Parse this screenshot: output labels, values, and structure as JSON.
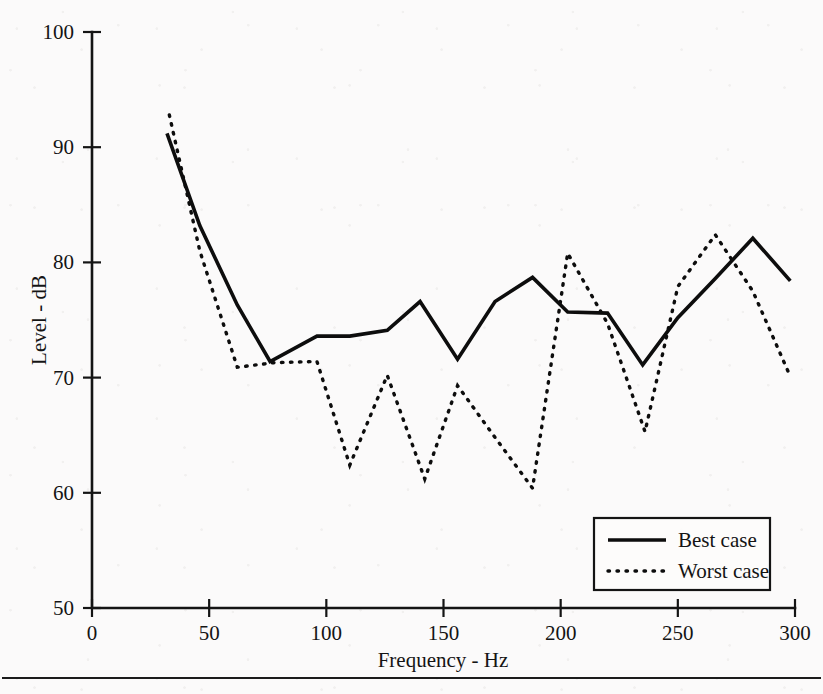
{
  "chart_data": {
    "type": "line",
    "title": "",
    "xlabel": "Frequency - Hz",
    "ylabel": "Level - dB",
    "xlim": [
      0,
      300
    ],
    "ylim": [
      50,
      100
    ],
    "xticks": [
      0,
      50,
      100,
      150,
      200,
      250,
      300
    ],
    "yticks": [
      50,
      60,
      70,
      80,
      90,
      100
    ],
    "xtick_labels": [
      "0",
      "50",
      "100",
      "150",
      "200",
      "250",
      "300"
    ],
    "ytick_labels": [
      "50",
      "60",
      "70",
      "80",
      "90",
      "100"
    ],
    "grid": false,
    "legend_position": "lower right",
    "series": [
      {
        "name": "Best case",
        "style": "solid",
        "color": "#0d0d0d",
        "x": [
          32,
          46,
          62,
          76,
          96,
          110,
          126,
          140,
          156,
          172,
          188,
          203,
          220,
          235,
          250,
          266,
          282,
          298
        ],
        "y": [
          91.2,
          83.2,
          76.3,
          71.4,
          73.6,
          73.6,
          74.1,
          76.6,
          71.6,
          76.6,
          78.7,
          75.7,
          75.6,
          71.1,
          75.2,
          78.6,
          82.1,
          78.4
        ]
      },
      {
        "name": "Worst case",
        "style": "dotted",
        "color": "#0d0d0d",
        "x": [
          33,
          46,
          62,
          78,
          96,
          110,
          126,
          142,
          156,
          172,
          188,
          203,
          220,
          236,
          250,
          266,
          282,
          298
        ],
        "y": [
          92.8,
          81.0,
          70.9,
          71.3,
          71.4,
          62.4,
          70.2,
          61.2,
          69.3,
          64.8,
          60.4,
          80.8,
          74.7,
          65.3,
          77.9,
          82.4,
          77.5,
          70.1
        ]
      }
    ]
  },
  "legend": {
    "entries": [
      {
        "label": "Best case",
        "style": "solid"
      },
      {
        "label": "Worst case",
        "style": "dotted"
      }
    ]
  },
  "axes": {
    "y_title": "Level - dB",
    "x_title": "Frequency - Hz"
  }
}
